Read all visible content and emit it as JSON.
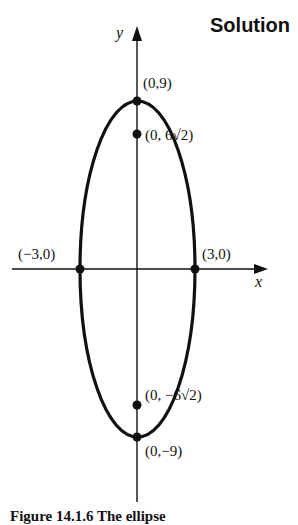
{
  "heading": "Solution",
  "diagram": {
    "axes": {
      "x_label": "x",
      "y_label": "y"
    },
    "ellipse": {
      "a": 3,
      "b": 9,
      "center": [
        0,
        0
      ]
    },
    "points": [
      {
        "label": "(0,9)",
        "x": 0,
        "y": 9,
        "type": "vertex"
      },
      {
        "label": "(0, 6√2)",
        "x": 0,
        "y": 8.485,
        "type": "focus"
      },
      {
        "label": "(−3,0)",
        "x": -3,
        "y": 0,
        "type": "co-vertex"
      },
      {
        "label": "(3,0)",
        "x": 3,
        "y": 0,
        "type": "co-vertex"
      },
      {
        "label": "(0, −6√2)",
        "x": 0,
        "y": -8.485,
        "type": "focus"
      },
      {
        "label": "(0,−9)",
        "x": 0,
        "y": -9,
        "type": "vertex"
      }
    ]
  },
  "caption": "Figure 14.1.6 The ellipse"
}
